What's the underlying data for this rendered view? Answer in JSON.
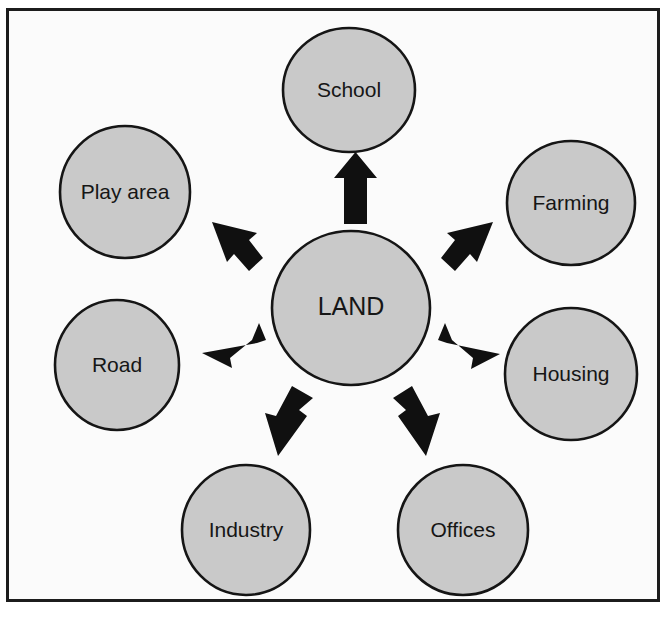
{
  "diagram": {
    "type": "radial-spider",
    "frame": {
      "border_color": "#1c1c1c",
      "background_color": "#fbfbfb",
      "x": 6,
      "y": 8,
      "width": 654,
      "height": 594,
      "border_width": 3
    },
    "style": {
      "node_fill": "#c9c9c9",
      "node_stroke": "#151515",
      "node_stroke_width": 2.6,
      "arrow_color": "#101010",
      "label_color": "#161616"
    },
    "center_node": {
      "id": "land",
      "label": "LAND",
      "cx": 351,
      "cy": 308,
      "rx": 79,
      "ry": 77,
      "font_size": 25
    },
    "nodes": [
      {
        "id": "school",
        "label": "School",
        "cx": 349,
        "cy": 90,
        "rx": 66,
        "ry": 62,
        "font_size": 21
      },
      {
        "id": "farming",
        "label": "Farming",
        "cx": 571,
        "cy": 203,
        "rx": 64,
        "ry": 62,
        "font_size": 21
      },
      {
        "id": "housing",
        "label": "Housing",
        "cx": 571,
        "cy": 374,
        "rx": 66,
        "ry": 66,
        "font_size": 21
      },
      {
        "id": "offices",
        "label": "Offices",
        "cx": 463,
        "cy": 530,
        "rx": 65,
        "ry": 65,
        "font_size": 21
      },
      {
        "id": "industry",
        "label": "Industry",
        "cx": 246,
        "cy": 530,
        "rx": 64,
        "ry": 65,
        "font_size": 21
      },
      {
        "id": "road",
        "label": "Road",
        "cx": 117,
        "cy": 365,
        "rx": 62,
        "ry": 65,
        "font_size": 21
      },
      {
        "id": "play_area",
        "label": "Play area",
        "cx": 125,
        "cy": 192,
        "rx": 65,
        "ry": 66,
        "font_size": 21
      }
    ],
    "arrows": [
      {
        "id": "land-to-school",
        "from": "land",
        "to": "school",
        "direction": "up"
      },
      {
        "id": "land-to-farming",
        "from": "land",
        "to": "farming",
        "direction": "up-right"
      },
      {
        "id": "land-to-housing",
        "from": "land",
        "to": "housing",
        "direction": "down-right"
      },
      {
        "id": "land-to-offices",
        "from": "land",
        "to": "offices",
        "direction": "down-right-steep"
      },
      {
        "id": "land-to-industry",
        "from": "land",
        "to": "industry",
        "direction": "down-left-steep"
      },
      {
        "id": "land-to-road",
        "from": "land",
        "to": "road",
        "direction": "down-left"
      },
      {
        "id": "land-to-play-area",
        "from": "land",
        "to": "play_area",
        "direction": "up-left"
      }
    ]
  }
}
